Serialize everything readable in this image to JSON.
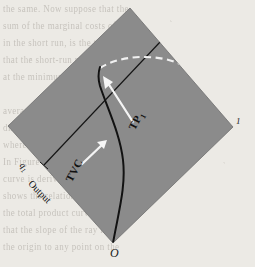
{
  "figure": {
    "type": "diagram",
    "plot_fill_color": "#8b8b8b",
    "page_color": "#ece9e4",
    "curve_color": "#141414",
    "dashed_curve_color": "#f2f2f2",
    "rotation_degrees": 45,
    "vertices": {
      "origin_label": "O",
      "right_label": "1",
      "origin_point": [
        113,
        243
      ],
      "left_point": [
        8,
        126
      ],
      "top_point": [
        130,
        8
      ],
      "right_point": [
        233,
        127
      ]
    },
    "axes": {
      "output_axis_label": "Output",
      "quantity_tick_label": "q",
      "quantity_tick_sub": "1"
    },
    "annotations": [
      {
        "label": "TVC",
        "sub": "",
        "arrow": "points up-right toward the solid total variable cost curve"
      },
      {
        "label": "TP",
        "sub": "1",
        "arrow": "points up-left toward the intersection of the curve and the straight ray"
      }
    ],
    "curves": {
      "solid_curve_name": "TVC",
      "dashed_curve_name": "total product envelope",
      "straight_line_name": "tangent ray"
    }
  },
  "background_text": {
    "note": "faint bleed-through text from the reverse of the scanned page",
    "lines": [
      "the same. Now suppose that the",
      "sum of the marginal costs of",
      "in the short run, is the total",
      "that the short-run marginal",
      "at the minimum point of the",
      "",
      "average variable cost curve",
      "diminishing returns sets in",
      "where output per unit of the",
      "In Figure the total variable",
      "curve is derived from the",
      "shows the relationship between",
      "the total product curve and",
      "that the slope of the ray from",
      "the origin to any point on the"
    ]
  }
}
